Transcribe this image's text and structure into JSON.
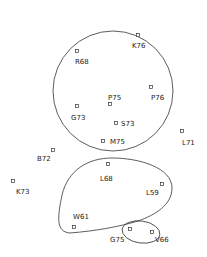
{
  "diagram": {
    "type": "cluster-scatter",
    "colors": {
      "stroke": "#333333",
      "text": "#222222",
      "background": "#ffffff"
    },
    "points": [
      {
        "id": "K76",
        "label": "K76",
        "x": 138,
        "y": 35,
        "lx": 132,
        "ly": 48
      },
      {
        "id": "R68",
        "label": "R68",
        "x": 77,
        "y": 51,
        "lx": 75,
        "ly": 64
      },
      {
        "id": "P76",
        "label": "P76",
        "x": 151,
        "y": 87,
        "lx": 151,
        "ly": 100
      },
      {
        "id": "P75",
        "label": "P75",
        "x": 110,
        "y": 104,
        "lx": 108,
        "ly": 100
      },
      {
        "id": "G73",
        "label": "G73",
        "x": 77,
        "y": 106,
        "lx": 71,
        "ly": 120
      },
      {
        "id": "S73",
        "label": "S73",
        "x": 116,
        "y": 123,
        "lx": 121,
        "ly": 126
      },
      {
        "id": "M75",
        "label": "M75",
        "x": 103,
        "y": 141,
        "lx": 110,
        "ly": 144
      },
      {
        "id": "L71",
        "label": "L71",
        "x": 182,
        "y": 131,
        "lx": 182,
        "ly": 145
      },
      {
        "id": "B72",
        "label": "B72",
        "x": 53,
        "y": 150,
        "lx": 37,
        "ly": 161
      },
      {
        "id": "L68",
        "label": "L68",
        "x": 108,
        "y": 164,
        "lx": 100,
        "ly": 181
      },
      {
        "id": "K73",
        "label": "K73",
        "x": 13,
        "y": 181,
        "lx": 16,
        "ly": 194
      },
      {
        "id": "L59",
        "label": "L59",
        "x": 162,
        "y": 184,
        "lx": 146,
        "ly": 195
      },
      {
        "id": "W61",
        "label": "W61",
        "x": 74,
        "y": 227,
        "lx": 73,
        "ly": 219
      },
      {
        "id": "G75",
        "label": "G75",
        "x": 130,
        "y": 229,
        "lx": 110,
        "ly": 242
      },
      {
        "id": "V66",
        "label": "V66",
        "x": 152,
        "y": 232,
        "lx": 155,
        "ly": 242
      }
    ],
    "clusters": [
      {
        "name": "upper-cluster",
        "members": [
          "K76",
          "R68",
          "P76",
          "P75",
          "G73",
          "S73",
          "M75"
        ]
      },
      {
        "name": "lower-cluster",
        "members": [
          "L68",
          "L59",
          "W61",
          "G75"
        ]
      },
      {
        "name": "small-cluster",
        "members": [
          "G75",
          "V66"
        ]
      }
    ]
  }
}
